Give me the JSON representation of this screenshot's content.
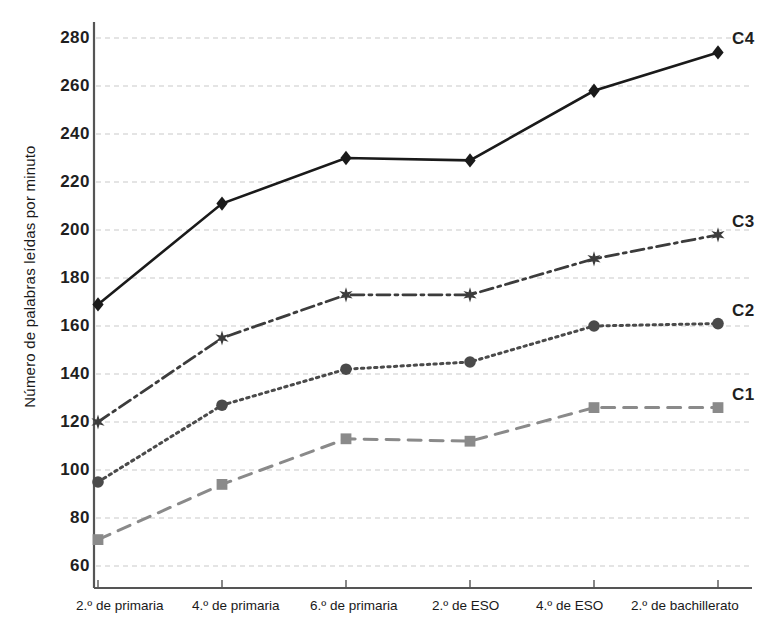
{
  "chart_data": {
    "type": "line",
    "title": "",
    "xlabel": "",
    "ylabel": "Número de palabras leídas por minuto",
    "categories": [
      "2.º de primaria",
      "4.º de primaria",
      "6.º de primaria",
      "2.º de ESO",
      "4.º de ESO",
      "2.º de bachillerato"
    ],
    "ylim": [
      60,
      290
    ],
    "yticks": [
      60,
      80,
      100,
      120,
      140,
      160,
      180,
      200,
      220,
      240,
      260,
      280
    ],
    "grid": true,
    "legend_position": "right-inline",
    "series": [
      {
        "name": "C4",
        "values": [
          169,
          211,
          230,
          229,
          258,
          274
        ],
        "color": "#1a1a1a",
        "marker": "diamond",
        "linestyle": "solid"
      },
      {
        "name": "C3",
        "values": [
          120,
          155,
          173,
          173,
          188,
          198
        ],
        "color": "#3c3c3c",
        "marker": "star",
        "linestyle": "dashdot"
      },
      {
        "name": "C2",
        "values": [
          95,
          127,
          142,
          145,
          160,
          161
        ],
        "color": "#4a4a4a",
        "marker": "circle",
        "linestyle": "dotted"
      },
      {
        "name": "C1",
        "values": [
          71,
          94,
          113,
          112,
          126,
          126
        ],
        "color": "#8a8a8a",
        "marker": "square",
        "linestyle": "dashed"
      }
    ]
  },
  "axis": {
    "ytick_labels": [
      "280",
      "260",
      "240",
      "220",
      "200",
      "180",
      "160",
      "140",
      "120",
      "100",
      "80",
      "60"
    ],
    "xtick_labels": [
      "2.º de primaria",
      "4.º de primaria",
      "6.º de primaria",
      "2.º de ESO",
      "4.º de ESO",
      "2.º de bachillerato"
    ]
  },
  "series_labels": {
    "c4": "C4",
    "c3": "C3",
    "c2": "C2",
    "c1": "C1"
  }
}
